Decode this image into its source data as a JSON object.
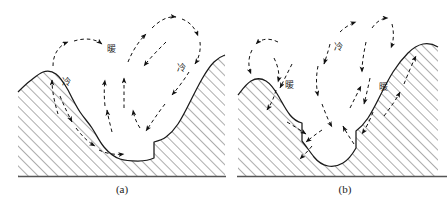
{
  "figure": {
    "title": "",
    "panels": [
      {
        "id": "a",
        "caption": "(a)",
        "labels": [
          {
            "name": "label-cold-left",
            "text": "冷",
            "x": 66,
            "y": 85
          },
          {
            "name": "label-warm-center",
            "text": "暖",
            "x": 111,
            "y": 52
          },
          {
            "name": "label-cold-right",
            "text": "冷",
            "x": 181,
            "y": 71
          }
        ]
      },
      {
        "id": "b",
        "caption": "(b)",
        "labels": [
          {
            "name": "label-warm-left",
            "text": "暖",
            "x": 289,
            "y": 88
          },
          {
            "name": "label-cold-center",
            "text": "冷",
            "x": 338,
            "y": 50
          },
          {
            "name": "label-warm-right",
            "text": "暖",
            "x": 383,
            "y": 90
          }
        ]
      }
    ],
    "colors": {
      "ink": "#1a1a1a",
      "hatch": "#4a4a4a",
      "baseline": "#555555",
      "background": "#ffffff"
    },
    "legend_terms": {
      "cold": "冷",
      "warm": "暖"
    }
  }
}
